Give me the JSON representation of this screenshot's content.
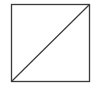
{
  "diagram": {
    "shape": "square-with-diagonal",
    "stroke_color": "#3a3a3a",
    "background": "#ffffff",
    "square": {
      "x": 11.5,
      "y": 4.5,
      "width": 78,
      "height": 77
    },
    "diagonal": {
      "from": "bottom-left",
      "to": "top-right"
    }
  }
}
